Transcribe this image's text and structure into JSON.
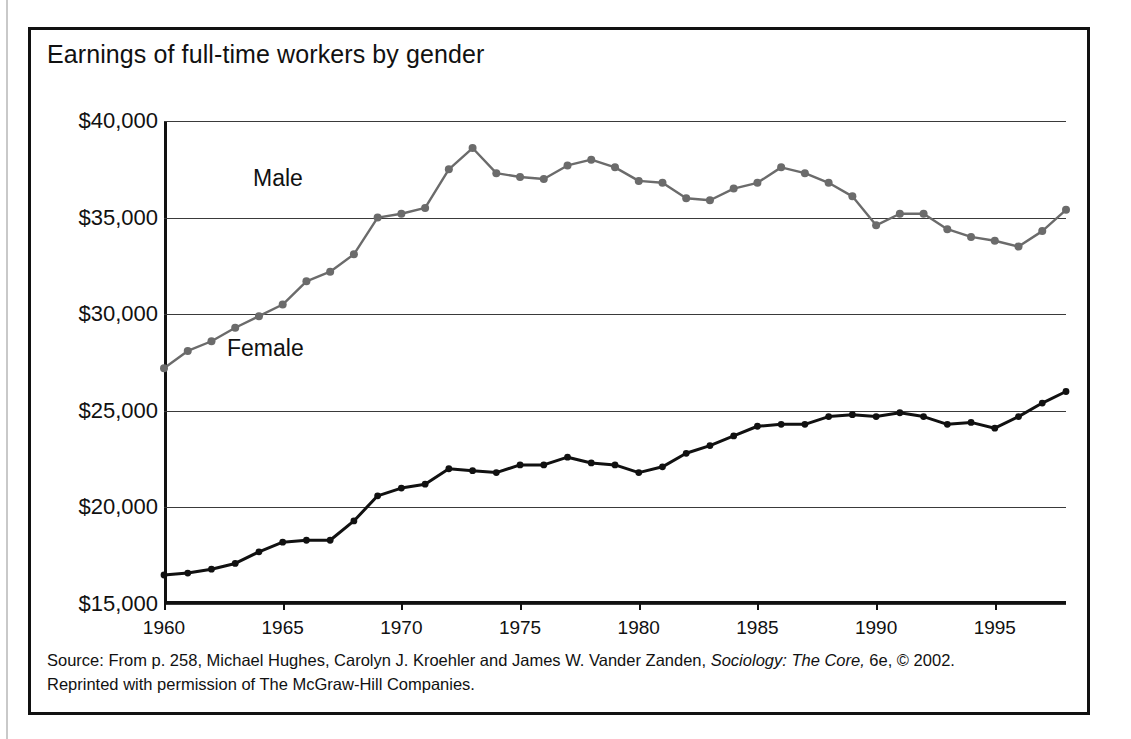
{
  "figure": {
    "title": "Earnings of full-time workers by gender",
    "source_line_1_a": "Source: From p. 258, Michael Hughes, Carolyn J. Kroehler and James W. Vander Zanden, ",
    "source_line_1_italic": "Sociology: The Core,",
    "source_line_1_b": " 6e, © 2002.",
    "source_line_2": "Reprinted with permission of The McGraw-Hill Companies."
  },
  "colors": {
    "male_line": "#6b6b6b",
    "female_line": "#111111",
    "border": "#111111",
    "gridline": "#3a3a3a"
  },
  "chart_data": {
    "type": "line",
    "title": "Earnings of full-time workers by gender",
    "xlabel": "",
    "ylabel": "",
    "xlim": [
      1960,
      1998
    ],
    "ylim": [
      15000,
      40000
    ],
    "grid": true,
    "legend": "inline-labels",
    "ytick_labels": [
      "$40,000",
      "$35,000",
      "$30,000",
      "$25,000",
      "$20,000",
      "$15,000"
    ],
    "ytick_values": [
      40000,
      35000,
      30000,
      25000,
      20000,
      15000
    ],
    "xtick_labels": [
      "1960",
      "1965",
      "1970",
      "1975",
      "1980",
      "1985",
      "1990",
      "1995"
    ],
    "xtick_values": [
      1960,
      1965,
      1970,
      1975,
      1980,
      1985,
      1990,
      1995
    ],
    "x": [
      1960,
      1961,
      1962,
      1963,
      1964,
      1965,
      1966,
      1967,
      1968,
      1969,
      1970,
      1971,
      1972,
      1973,
      1974,
      1975,
      1976,
      1977,
      1978,
      1979,
      1980,
      1981,
      1982,
      1983,
      1984,
      1985,
      1986,
      1987,
      1988,
      1989,
      1990,
      1991,
      1992,
      1993,
      1994,
      1995,
      1996,
      1997,
      1998
    ],
    "series": [
      {
        "name": "Male",
        "color": "#6b6b6b",
        "marker": "circle",
        "values": [
          27200,
          28100,
          28600,
          29300,
          29900,
          30500,
          31700,
          32200,
          33100,
          35000,
          35200,
          35500,
          37500,
          38600,
          37300,
          37100,
          37000,
          37700,
          38000,
          37600,
          36900,
          36800,
          36000,
          35900,
          36500,
          36800,
          37600,
          37300,
          36800,
          36100,
          34600,
          35200,
          35200,
          34400,
          34000,
          33800,
          33500,
          34300,
          35400
        ]
      },
      {
        "name": "Female",
        "color": "#111111",
        "marker": "circle",
        "values": [
          16500,
          16600,
          16800,
          17100,
          17700,
          18200,
          18300,
          18300,
          19300,
          20600,
          21000,
          21200,
          22000,
          21900,
          21800,
          22200,
          22200,
          22600,
          22300,
          22200,
          21800,
          22100,
          22800,
          23200,
          23700,
          24200,
          24300,
          24300,
          24700,
          24800,
          24700,
          24900,
          24700,
          24300,
          24400,
          24100,
          24700,
          25400,
          26000
        ]
      }
    ]
  }
}
